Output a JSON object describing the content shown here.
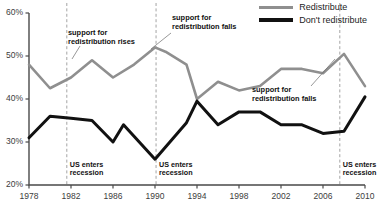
{
  "chart_data": {
    "type": "line",
    "title": "",
    "xlabel": "",
    "ylabel": "",
    "xlim": [
      1978,
      2010
    ],
    "ylim": [
      20,
      60
    ],
    "ytick_labels": [
      "60%",
      "50%",
      "40%",
      "30%",
      "20%"
    ],
    "ytick_values": [
      60,
      50,
      40,
      30,
      20
    ],
    "xtick_labels": [
      "1978",
      "1982",
      "1986",
      "1990",
      "1994",
      "1998",
      "2002",
      "2006",
      "2010"
    ],
    "xtick_values": [
      1978,
      1982,
      1986,
      1990,
      1994,
      1998,
      2002,
      2006,
      2010
    ],
    "grid": false,
    "legend_position": "top-right",
    "series": [
      {
        "name": "Redistribute",
        "color": "#8f8f8f",
        "width": 2.6,
        "x": [
          1978,
          1980,
          1982,
          1984,
          1986,
          1988,
          1990,
          1991,
          1993,
          1994,
          1996,
          1998,
          2000,
          2002,
          2004,
          2006,
          2008,
          2010
        ],
        "values": [
          48.0,
          42.5,
          45.0,
          49.0,
          45.0,
          48.0,
          52.0,
          51.0,
          48.0,
          40.0,
          44.0,
          42.0,
          43.0,
          47.0,
          47.0,
          46.0,
          50.5,
          43.0
        ]
      },
      {
        "name": "Don't redistribute",
        "color": "#111111",
        "width": 3.0,
        "x": [
          1978,
          1980,
          1982,
          1984,
          1986,
          1987,
          1990,
          1993,
          1994,
          1996,
          1998,
          2000,
          2002,
          2004,
          2006,
          2008,
          2010
        ],
        "values": [
          31.0,
          36.0,
          35.5,
          35.0,
          30.0,
          34.0,
          26.0,
          34.5,
          39.5,
          34.0,
          37.0,
          37.0,
          34.0,
          34.0,
          32.0,
          32.5,
          40.5
        ]
      }
    ],
    "vlines": [
      {
        "x": 1981.6,
        "label": "US enters\nrecession"
      },
      {
        "x": 1990.1,
        "label": "US enters\nrecession"
      },
      {
        "x": 2007.6,
        "label": "US enters\nrecession"
      }
    ],
    "annotations": [
      {
        "text": "support for\nredistribution rises",
        "x": 68,
        "y": 29,
        "lx1": 80,
        "ly1": 46,
        "lx2": 72,
        "ly2": 59
      },
      {
        "text": "support for\nredistribution falls",
        "x": 172,
        "y": 14,
        "lx1": 171,
        "ly1": 33,
        "lx2": 151,
        "ly2": 49
      },
      {
        "text": "support for\nredistribution falls",
        "x": 252,
        "y": 86,
        "lx1": 311,
        "ly1": 86,
        "lx2": 335,
        "ly2": 59
      }
    ]
  },
  "legend": {
    "items": [
      {
        "label": "Redistribute",
        "color": "#8f8f8f",
        "width": 3
      },
      {
        "label": "Don't redistribute",
        "color": "#111111",
        "width": 4
      }
    ]
  },
  "axis": {
    "y_ticks": [
      "60%",
      "50%",
      "40%",
      "30%",
      "20%"
    ],
    "x_ticks": [
      "1978",
      "1982",
      "1986",
      "1990",
      "1994",
      "1998",
      "2002",
      "2006",
      "2010"
    ]
  }
}
